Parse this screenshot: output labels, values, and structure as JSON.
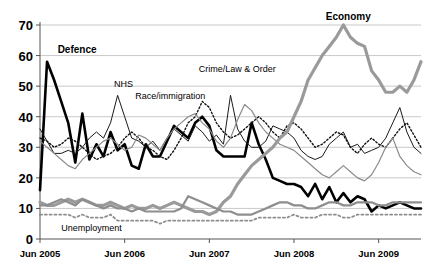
{
  "chart_data": {
    "type": "line",
    "title": "",
    "xlabel": "",
    "ylabel": "",
    "ylim": [
      0,
      70
    ],
    "grid": true,
    "legend_position": "inline-annotations",
    "x_tick_labels": [
      "Jun 2005",
      "Jun 2006",
      "Jun 2007",
      "Jun 2008",
      "Jun 2009"
    ],
    "x_tick_values": [
      0,
      12,
      24,
      36,
      48
    ],
    "y_tick_labels": [
      "0",
      "10",
      "20",
      "30",
      "40",
      "50",
      "60",
      "70"
    ],
    "y_tick_values": [
      0,
      10,
      20,
      30,
      40,
      50,
      60,
      70
    ],
    "x_index_range": [
      0,
      54
    ],
    "annotations": [
      {
        "text": "Defence",
        "x_index": 2.5,
        "value": 62,
        "bold": true
      },
      {
        "text": "NHS",
        "x_index": 10.5,
        "value": 51,
        "bold": false
      },
      {
        "text": "Race/immigration",
        "x_index": 13.5,
        "value": 47,
        "bold": false
      },
      {
        "text": "Crime/Law & Order",
        "x_index": 22.5,
        "value": 56,
        "bold": false
      },
      {
        "text": "Economy",
        "x_index": 40.5,
        "value": 73,
        "bold": true
      },
      {
        "text": "Unemployment",
        "x_index": 3.0,
        "value": 4,
        "bold": false
      }
    ],
    "series": [
      {
        "name": "Defence",
        "style": "solid",
        "color": "#000000",
        "width": 2.6,
        "values": [
          16,
          58,
          52,
          45,
          38,
          25,
          41,
          26,
          31,
          27,
          35,
          29,
          31,
          24,
          23,
          31,
          27,
          27,
          32,
          37,
          35,
          33,
          38,
          40,
          37,
          29,
          27,
          27,
          27,
          27,
          38,
          31,
          26,
          20,
          19,
          18,
          18,
          17,
          14,
          18,
          13,
          17,
          12,
          15,
          12,
          14,
          13,
          9,
          11,
          10,
          11,
          12,
          11,
          10,
          10
        ]
      },
      {
        "name": "NHS",
        "style": "solid",
        "color": "#1a1a1a",
        "width": 1.0,
        "values": [
          36,
          32,
          28,
          28,
          29,
          28,
          30,
          33,
          35,
          33,
          38,
          47,
          40,
          33,
          32,
          30,
          32,
          29,
          33,
          36,
          34,
          32,
          37,
          35,
          32,
          34,
          31,
          47,
          36,
          32,
          30,
          30,
          32,
          37,
          36,
          35,
          33,
          29,
          27,
          26,
          27,
          31,
          33,
          35,
          30,
          31,
          28,
          29,
          30,
          33,
          38,
          43,
          35,
          30,
          28
        ]
      },
      {
        "name": "Race/immigration",
        "style": "dotted",
        "color": "#111111",
        "width": 1.4,
        "values": [
          33,
          32,
          30,
          31,
          33,
          32,
          30,
          28,
          26,
          27,
          28,
          30,
          33,
          35,
          33,
          30,
          29,
          27,
          26,
          29,
          33,
          38,
          40,
          45,
          43,
          38,
          35,
          33,
          34,
          36,
          38,
          40,
          38,
          35,
          33,
          37,
          38,
          36,
          33,
          30,
          31,
          33,
          35,
          34,
          30,
          28,
          31,
          33,
          31,
          30,
          33,
          36,
          38,
          34,
          30
        ]
      },
      {
        "name": "Crime/Law & Order",
        "style": "solid",
        "color": "#8a8a8a",
        "width": 1.2,
        "values": [
          32,
          30,
          28,
          26,
          24,
          23,
          26,
          28,
          30,
          32,
          33,
          31,
          29,
          30,
          34,
          33,
          31,
          29,
          33,
          36,
          38,
          40,
          41,
          38,
          36,
          32,
          30,
          33,
          39,
          44,
          42,
          38,
          35,
          33,
          31,
          30,
          29,
          27,
          25,
          23,
          21,
          20,
          22,
          24,
          22,
          20,
          19,
          21,
          25,
          30,
          33,
          27,
          24,
          22,
          21
        ]
      },
      {
        "name": "Economy",
        "style": "solid",
        "color": "#9a9a9a",
        "width": 3.2,
        "values": [
          12,
          11,
          11,
          12,
          13,
          12,
          13,
          12,
          11,
          11,
          12,
          11,
          10,
          11,
          10,
          10,
          11,
          10,
          11,
          12,
          11,
          10,
          9,
          9,
          8,
          9,
          12,
          14,
          18,
          21,
          24,
          26,
          28,
          30,
          33,
          35,
          40,
          45,
          52,
          56,
          60,
          63,
          66,
          70,
          66,
          64,
          63,
          55,
          52,
          48,
          48,
          50,
          48,
          52,
          58
        ]
      },
      {
        "name": "Unemployment",
        "style": "solid",
        "color": "#8e8e8e",
        "width": 2.2,
        "values": [
          11,
          11,
          12,
          13,
          12,
          11,
          13,
          12,
          11,
          10,
          11,
          10,
          10,
          9,
          10,
          9,
          9,
          9,
          9,
          9,
          10,
          14,
          13,
          12,
          11,
          10,
          9,
          9,
          8,
          8,
          8,
          9,
          10,
          11,
          12,
          12,
          11,
          11,
          10,
          10,
          11,
          12,
          12,
          11,
          11,
          12,
          12,
          12,
          11,
          11,
          12,
          12,
          12,
          12,
          12
        ]
      },
      {
        "name": "Unemployment-dotted",
        "style": "dotted",
        "color": "#8e8e8e",
        "width": 1.8,
        "values": [
          8,
          8,
          8,
          8,
          8,
          7,
          8,
          7,
          7,
          7,
          8,
          6,
          6,
          6,
          6,
          6,
          6,
          5,
          6,
          6,
          6,
          6,
          6,
          6,
          6,
          6,
          6,
          6,
          6,
          6,
          6,
          7,
          7,
          7,
          7,
          7,
          8,
          7,
          7,
          7,
          8,
          8,
          8,
          7,
          7,
          8,
          8,
          8,
          8,
          8,
          8,
          8,
          8,
          8,
          8
        ]
      }
    ]
  }
}
